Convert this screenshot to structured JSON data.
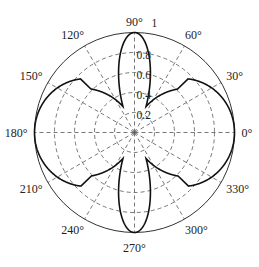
{
  "chart_data": {
    "type": "polar-line",
    "title": "",
    "theta_unit": "degrees",
    "angle_tick_labels": [
      "0°",
      "30°",
      "60°",
      "90°",
      "120°",
      "150°",
      "180°",
      "210°",
      "240°",
      "270°",
      "300°",
      "330°"
    ],
    "angle_ticks": [
      0,
      30,
      60,
      90,
      120,
      150,
      180,
      210,
      240,
      270,
      300,
      330
    ],
    "radial_tick_labels": [
      "0.2",
      "0.4",
      "0.6",
      "0.8",
      "1"
    ],
    "radial_ticks": [
      0.2,
      0.4,
      0.6,
      0.8,
      1.0
    ],
    "rlim": [
      0,
      1
    ],
    "grid": true,
    "grid_style": "dashed",
    "series": [
      {
        "name": "pattern",
        "description": "Four-lobed pattern: wide lobes at 0° and 180°, narrow lobes at 90° and 270°, all reaching r = 1",
        "horizontal_lobe_exponent": 0.8,
        "vertical_lobe_exponent": 14,
        "sample_points": [
          {
            "theta": 0,
            "r": 1.0
          },
          {
            "theta": 30,
            "r": 0.89
          },
          {
            "theta": 36,
            "r": 0.84
          },
          {
            "theta": 60,
            "r": 0.57
          },
          {
            "theta": 80,
            "r": 0.25
          },
          {
            "theta": 90,
            "r": 1.0
          },
          {
            "theta": 180,
            "r": 1.0
          },
          {
            "theta": 270,
            "r": 1.0
          }
        ]
      }
    ]
  }
}
